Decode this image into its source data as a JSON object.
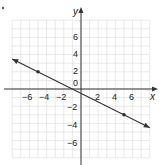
{
  "chart_data": {
    "type": "line",
    "title": "",
    "xlabel": "x",
    "ylabel": "y",
    "xlim": [
      -8,
      8
    ],
    "ylim": [
      -8,
      8
    ],
    "grid": true,
    "x_ticks": [
      "−6",
      "−4",
      "−2",
      "2",
      "4",
      "6"
    ],
    "y_ticks": [
      "6",
      "4",
      "2",
      "0",
      "−2",
      "−4",
      "−6"
    ],
    "series": [
      {
        "name": "line",
        "equation": "y = -0.5x - 0.5",
        "slope": -0.5,
        "intercept": -0.5,
        "arrows_both_ends": true,
        "endpoints": [
          [
            -8,
            3.5
          ],
          [
            8,
            -4.5
          ]
        ],
        "marked_points": [
          [
            -5,
            2
          ],
          [
            5,
            -3
          ]
        ]
      }
    ]
  },
  "labels": {
    "x_axis": "x",
    "y_axis": "y",
    "origin": "0",
    "x_tick_labels": [
      "−6",
      "−4",
      "−2",
      "2",
      "4",
      "6"
    ],
    "y_tick_labels_pos": [
      "6",
      "4",
      "2"
    ],
    "y_tick_labels_neg": [
      "−2",
      "−4",
      "−6"
    ]
  },
  "colors": {
    "grid": "#d8d8d8",
    "axis": "#333333",
    "line": "#333333",
    "text": "#222222"
  }
}
